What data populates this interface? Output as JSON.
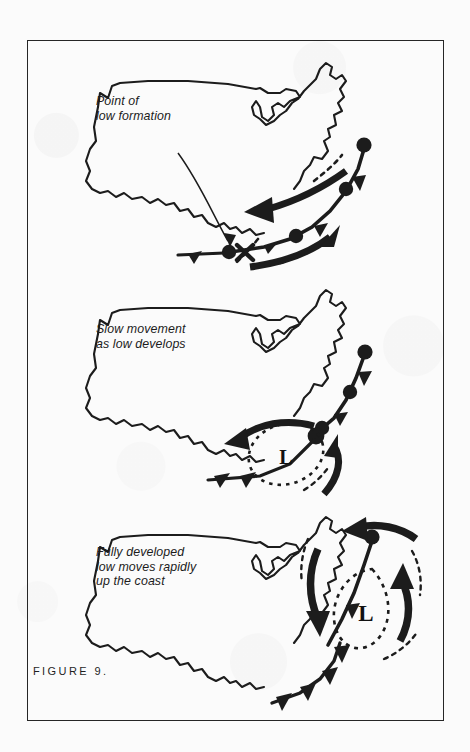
{
  "figure": {
    "label": "FIGURE 9.",
    "ink_color": "#1c1c1c",
    "background_color": "#fbfbfb",
    "frame_color": "#262626"
  },
  "panels": [
    {
      "id": "panel-1",
      "caption": "Point of\nlow formation",
      "stage": "formation",
      "low_marker": "x-marker",
      "low_label": "",
      "fronts": [
        "stationary-front",
        "cold-front",
        "occluded-front"
      ],
      "arrows": [
        "outflow-arrow-west",
        "inflow-arrow-east"
      ]
    },
    {
      "id": "panel-2",
      "caption": "Slow movement\nas low develops",
      "stage": "developing",
      "low_marker": "dashed-ellipse",
      "low_label": "L",
      "fronts": [
        "occluded-front",
        "cold-front",
        "warm-front"
      ],
      "arrows": [
        "outflow-arrow-west",
        "inflow-arrow-southeast"
      ]
    },
    {
      "id": "panel-3",
      "caption": "Fully developed\nlow moves rapidly\nup the coast",
      "stage": "mature",
      "low_marker": "dashed-teardrop",
      "low_label": "L",
      "fronts": [
        "occluded-front",
        "cold-front",
        "warm-front"
      ],
      "arrows": [
        "circulation-arrow-north",
        "circulation-arrow-south",
        "circulation-arrow-east",
        "circulation-arrow-west"
      ]
    }
  ],
  "map": {
    "name": "united-states-outline",
    "region": "contiguous-united-states"
  }
}
